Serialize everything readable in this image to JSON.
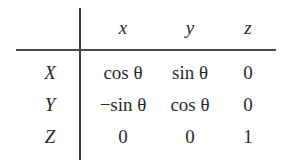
{
  "table": {
    "column_headers": [
      "x",
      "y",
      "z"
    ],
    "rows": [
      {
        "label": "X",
        "cells": [
          "cos θ",
          "sin θ",
          "0"
        ]
      },
      {
        "label": "Y",
        "cells": [
          "−sin θ",
          "cos θ",
          "0"
        ]
      },
      {
        "label": "Z",
        "cells": [
          "0",
          "0",
          "1"
        ]
      }
    ]
  }
}
